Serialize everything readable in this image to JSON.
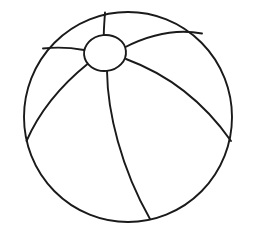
{
  "document": {
    "title": "Beach Ball",
    "type": "line-art-coloring-page",
    "background_color": "#ffffff",
    "stroke_color": "#1a1a1a",
    "fill_color": "#ffffff",
    "canvas": {
      "width": 253,
      "height": 236
    }
  },
  "artwork": {
    "subject": "beach-ball",
    "description": "Black outline drawing of a beach ball with a small oval hub near the top and five curved seam lines dividing the sphere into panels.",
    "ball": {
      "center_x": 128,
      "center_y": 117,
      "radius_x": 104,
      "radius_y": 105,
      "stroke_width": 1.9
    },
    "hub": {
      "label": "center-cap",
      "center_x": 105,
      "center_y": 53,
      "radius_x": 21,
      "radius_y": 18,
      "rotation": -6,
      "stroke_width": 1.9
    },
    "seams": [
      {
        "name": "seam-top-vertical",
        "path": "M 104 35 C 104 28 104.5 22 105 12"
      },
      {
        "name": "seam-upper-right",
        "path": "M 125 48 C 152 34 178 29 202 33"
      },
      {
        "name": "seam-right-sweep",
        "path": "M 126 59 C 163 72 200 96 231 140"
      },
      {
        "name": "seam-center-descending",
        "path": "M 107 71 C 108 112 122 168 150 219"
      },
      {
        "name": "seam-lower-left",
        "path": "M 87 64 C 63 83 40 108 26 141"
      },
      {
        "name": "seam-upper-left",
        "path": "M 84 50 C 70 48 56 47 43 48"
      }
    ]
  },
  "controls": {
    "canvas_label": "drawing-canvas"
  }
}
